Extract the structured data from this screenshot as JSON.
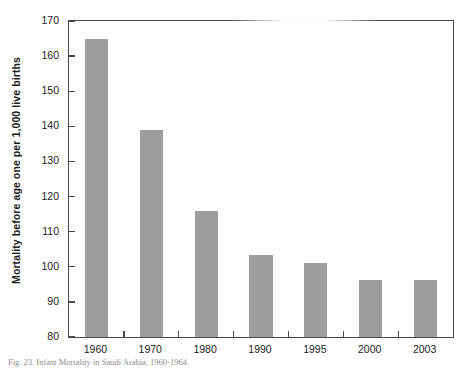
{
  "chart_data": {
    "type": "bar",
    "title": "",
    "xlabel": "",
    "ylabel": "Mortality before age one per 1,000 live births",
    "categories": [
      "1960",
      "1970",
      "1980",
      "1990",
      "1995",
      "2000",
      "2003"
    ],
    "values": [
      165.0,
      139.0,
      116.0,
      103.3,
      101.0,
      96.3,
      96.3
    ],
    "ylim": [
      80,
      170
    ],
    "yticks": [
      80,
      90,
      100,
      110,
      120,
      130,
      140,
      150,
      160,
      170
    ],
    "ytick_labels": [
      "80",
      "90",
      "100",
      "110",
      "120",
      "130",
      "140",
      "150",
      "160",
      "170"
    ],
    "grid": false,
    "legend": "none",
    "bar_color": "#9e9e9e",
    "axis_color": "#4a4a4a",
    "text_color": "#1d1d1d"
  },
  "caption": {
    "text": "Fig. 23. Infant Mortality in Saudi Arabia, 1960-1964"
  }
}
